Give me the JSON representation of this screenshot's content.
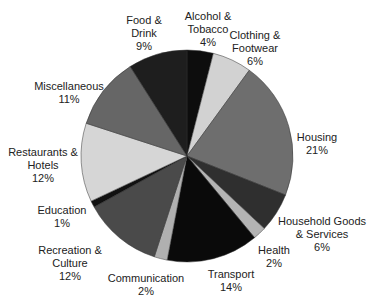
{
  "chart_data": {
    "type": "pie",
    "title": "",
    "start_angle": "top, clockwise",
    "slices": [
      {
        "label": "Alcohol & Tobacco",
        "lines": [
          "Alcohol &",
          "Tobacco",
          "4%"
        ],
        "value": 4,
        "color": "#0d0d0d",
        "lx": 208,
        "ly": 10
      },
      {
        "label": "Clothing & Footwear",
        "lines": [
          "Clothing &",
          "Footwear",
          "6%"
        ],
        "value": 6,
        "color": "#d2d2d2",
        "lx": 255,
        "ly": 29
      },
      {
        "label": "Housing",
        "lines": [
          "Housing",
          "21%"
        ],
        "value": 21,
        "color": "#6e6e6e",
        "lx": 317,
        "ly": 131
      },
      {
        "label": "Household Goods & Services",
        "lines": [
          "Household Goods",
          "& Services",
          "6%"
        ],
        "value": 6,
        "color": "#2f2f2f",
        "lx": 322,
        "ly": 215
      },
      {
        "label": "Health",
        "lines": [
          "Health",
          "2%"
        ],
        "value": 2,
        "color": "#b4b4b4",
        "lx": 274,
        "ly": 244
      },
      {
        "label": "Transport",
        "lines": [
          "Transport",
          "14%"
        ],
        "value": 14,
        "color": "#0a0a0a",
        "lx": 231,
        "ly": 268
      },
      {
        "label": "Communication",
        "lines": [
          "Communication",
          "2%"
        ],
        "value": 2,
        "color": "#b0b0b0",
        "lx": 146,
        "ly": 272
      },
      {
        "label": "Recreation & Culture",
        "lines": [
          "Recreation &",
          "Culture",
          "12%"
        ],
        "value": 12,
        "color": "#4a4a4a",
        "lx": 70,
        "ly": 244
      },
      {
        "label": "Education",
        "lines": [
          "Education",
          "1%"
        ],
        "value": 1,
        "color": "#111111",
        "lx": 62,
        "ly": 204
      },
      {
        "label": "Restaurants & Hotels",
        "lines": [
          "Restaurants &",
          "Hotels",
          "12%"
        ],
        "value": 12,
        "color": "#d6d6d6",
        "lx": 43,
        "ly": 146
      },
      {
        "label": "Miscellaneous",
        "lines": [
          "Miscellaneous",
          "11%"
        ],
        "value": 11,
        "color": "#666666",
        "lx": 69,
        "ly": 80
      },
      {
        "label": "Food & Drink",
        "lines": [
          "Food &",
          "Drink",
          "9%"
        ],
        "value": 9,
        "color": "#1e1e1e",
        "lx": 144,
        "ly": 14
      }
    ],
    "center": [
      187,
      156
    ],
    "radius": 106
  }
}
